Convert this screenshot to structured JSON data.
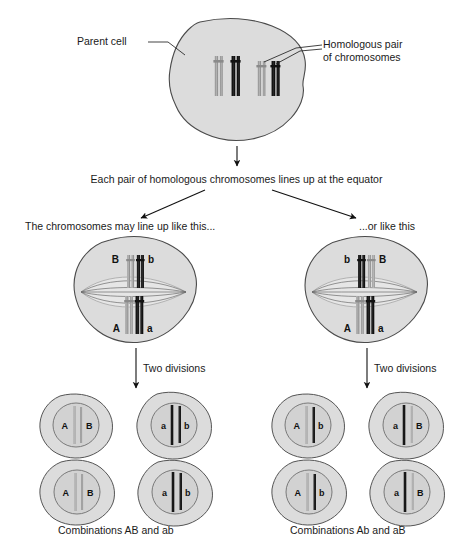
{
  "diagram": {
    "colors": {
      "cell_fill": "#dcdcdc",
      "cell_stroke": "#4a4a4a",
      "nucleus_fill": "#d2d2d2",
      "nucleus_stroke": "#6e6e6e",
      "chromosome_light": "#a8a8a8",
      "chromosome_dark": "#1c1c1c",
      "spindle_stroke": "#6b6b6b",
      "text": "#1a1a1a",
      "arrow": "#111111",
      "background": "#ffffff"
    },
    "labels": {
      "parent_cell": "Parent cell",
      "homologous_pair_line1": "Homologous pair",
      "homologous_pair_line2": "of chromosomes",
      "equator_text": "Each pair of homologous chromosomes lines up at the equator",
      "branch_left": "The chromosomes may line up like this...",
      "branch_right": "...or like this",
      "two_divisions_left": "Two divisions",
      "two_divisions_right": "Two divisions",
      "combinations_left": "Combinations AB and ab",
      "combinations_right": "Combinations Ab and aB"
    },
    "parent_cell": {
      "chromosomes": [
        {
          "allele": "A",
          "shade": "light"
        },
        {
          "allele": "a",
          "shade": "dark"
        },
        {
          "allele": "B",
          "shade": "light"
        },
        {
          "allele": "b",
          "shade": "dark"
        }
      ]
    },
    "metaphase_left": {
      "top_labels": [
        "B",
        "b"
      ],
      "top_shades": [
        "light",
        "dark"
      ],
      "bottom_labels": [
        "A",
        "a"
      ],
      "bottom_shades": [
        "light",
        "dark"
      ]
    },
    "metaphase_right": {
      "top_labels": [
        "b",
        "B"
      ],
      "top_shades": [
        "dark",
        "light"
      ],
      "bottom_labels": [
        "A",
        "a"
      ],
      "bottom_shades": [
        "light",
        "dark"
      ]
    },
    "gametes_left": [
      {
        "position": "top-left",
        "alleles": [
          "A",
          "B"
        ],
        "shades": [
          "light",
          "light"
        ]
      },
      {
        "position": "top-right",
        "alleles": [
          "a",
          "b"
        ],
        "shades": [
          "dark",
          "dark"
        ]
      },
      {
        "position": "bottom-left",
        "alleles": [
          "A",
          "B"
        ],
        "shades": [
          "light",
          "light"
        ]
      },
      {
        "position": "bottom-right",
        "alleles": [
          "a",
          "b"
        ],
        "shades": [
          "dark",
          "dark"
        ]
      }
    ],
    "gametes_right": [
      {
        "position": "top-left",
        "alleles": [
          "A",
          "b"
        ],
        "shades": [
          "light",
          "dark"
        ]
      },
      {
        "position": "top-right",
        "alleles": [
          "a",
          "B"
        ],
        "shades": [
          "dark",
          "light"
        ]
      },
      {
        "position": "bottom-left",
        "alleles": [
          "A",
          "b"
        ],
        "shades": [
          "light",
          "dark"
        ]
      },
      {
        "position": "bottom-right",
        "alleles": [
          "a",
          "B"
        ],
        "shades": [
          "dark",
          "light"
        ]
      }
    ]
  }
}
